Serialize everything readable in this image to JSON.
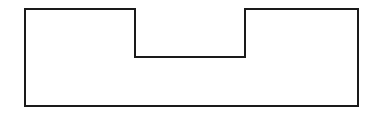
{
  "canvas": {
    "width": 370,
    "height": 116,
    "background": "#ffffff"
  },
  "shape": {
    "kind": "notched-rectangle-outline",
    "stroke": "#1a1a1a",
    "stroke_width": 2,
    "fill": "none",
    "points": [
      [
        25,
        9
      ],
      [
        135,
        9
      ],
      [
        135,
        57
      ],
      [
        245,
        57
      ],
      [
        245,
        9
      ],
      [
        358,
        9
      ],
      [
        358,
        106
      ],
      [
        25,
        106
      ]
    ]
  }
}
